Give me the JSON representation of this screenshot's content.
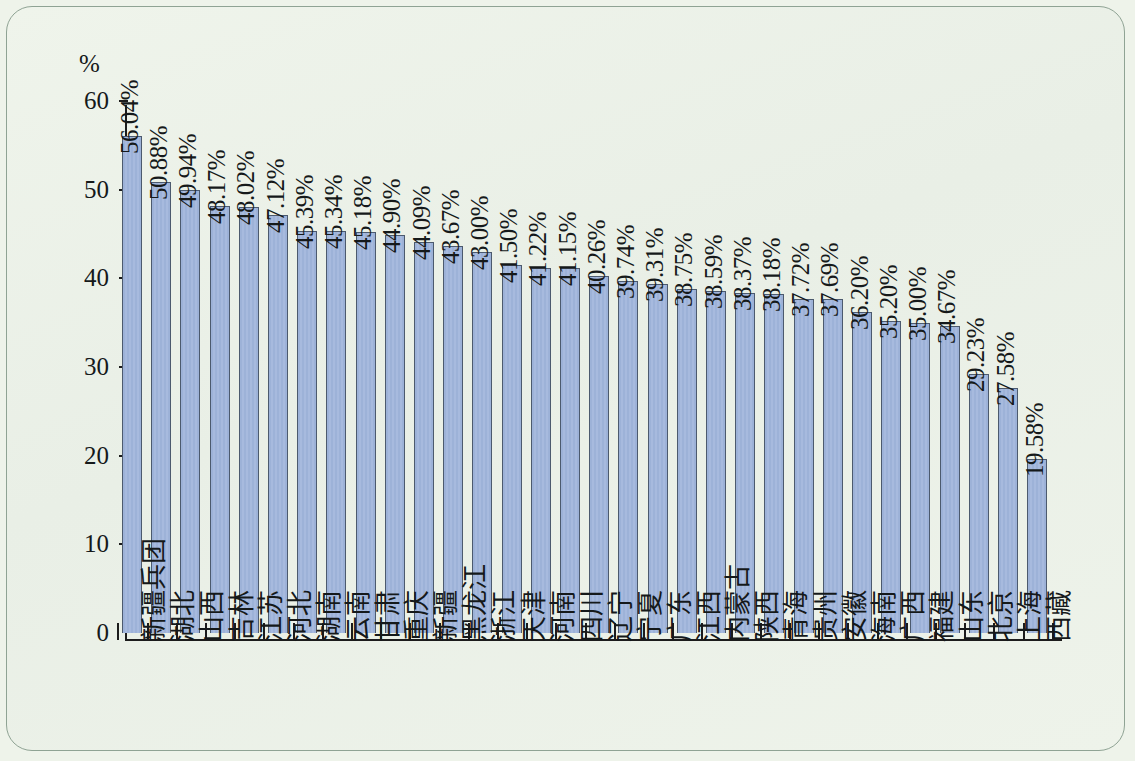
{
  "chart_data": {
    "type": "bar",
    "title": "",
    "xlabel": "",
    "ylabel": "%",
    "ylim": [
      0,
      60
    ],
    "ytick_step": 10,
    "yticks": [
      0,
      10,
      20,
      30,
      40,
      50,
      60
    ],
    "ytick_labels": [
      "0",
      "10",
      "20",
      "30",
      "40",
      "50",
      "60"
    ],
    "grid": false,
    "legend": "none",
    "value_label_suffix": "%",
    "categories": [
      "新疆兵团",
      "湖北",
      "山西",
      "吉林",
      "江苏",
      "河北",
      "湖南",
      "云南",
      "甘肃",
      "重庆",
      "新疆",
      "黑龙江",
      "浙江",
      "天津",
      "河南",
      "四川",
      "辽宁",
      "宁夏",
      "广东",
      "江西",
      "内蒙古",
      "陕西",
      "青海",
      "贵州",
      "安徽",
      "海南",
      "广西",
      "福建",
      "山东",
      "北京",
      "上海",
      "西藏"
    ],
    "values": [
      56.04,
      50.88,
      49.94,
      48.17,
      48.02,
      47.12,
      45.39,
      45.34,
      45.18,
      44.9,
      44.09,
      43.67,
      43.0,
      41.5,
      41.22,
      41.15,
      40.26,
      39.74,
      39.31,
      38.75,
      38.59,
      38.37,
      38.18,
      37.72,
      37.69,
      36.2,
      35.2,
      35.0,
      34.67,
      29.23,
      27.58,
      19.58
    ],
    "value_labels": [
      "56.04%",
      "50.88%",
      "49.94%",
      "48.17%",
      "48.02%",
      "47.12%",
      "45.39%",
      "45.34%",
      "45.18%",
      "44.90%",
      "44.09%",
      "43.67%",
      "43.00%",
      "41.50%",
      "41.22%",
      "41.15%",
      "40.26%",
      "39.74%",
      "39.31%",
      "38.75%",
      "38.59%",
      "38.37%",
      "38.18%",
      "37.72%",
      "37.69%",
      "36.20%",
      "35.20%",
      "35.00%",
      "34.67%",
      "29.23%",
      "27.58%",
      "19.58%"
    ],
    "colors": {
      "bar_fill": "#9db2d8",
      "bar_edge": "#4c5a6e",
      "axis": "#1c1c1c",
      "text": "#15191a",
      "background": "#eef3ea",
      "frame_border": "#8fa394"
    }
  }
}
